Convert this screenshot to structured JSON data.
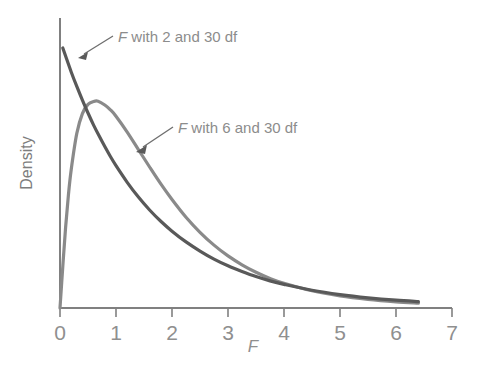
{
  "chart_data": {
    "type": "line",
    "title": "",
    "subtitle": "",
    "xlabel": "F",
    "ylabel": "Density",
    "xlim": [
      0,
      7
    ],
    "ylim": [
      0,
      1.05
    ],
    "grid": false,
    "legend_position": "inline-annotations",
    "x_ticks": [
      "0",
      "1",
      "2",
      "3",
      "4",
      "5",
      "6",
      "7"
    ],
    "x_tick_values": [
      0,
      1,
      2,
      3,
      4,
      5,
      6,
      7
    ],
    "y_ticks": [],
    "colors": {
      "curve_2_30": "#595959",
      "curve_6_30": "#8a8a8a",
      "axis": "#808080",
      "text": "#8c8c8c"
    },
    "annotations": [
      {
        "name": "label-f-2-30",
        "text": "F with 2 and 30 df",
        "target_x": 0.35,
        "target_y": 0.86
      },
      {
        "name": "label-f-6-30",
        "text": "F with 6 and 30 df",
        "target_x": 1.38,
        "target_y": 0.58
      }
    ],
    "series": [
      {
        "name": "F with 2 and 30 df",
        "df1": 2,
        "df2": 30,
        "color": "#595959",
        "x": [
          0.05,
          0.1,
          0.2,
          0.3,
          0.4,
          0.5,
          0.6,
          0.7,
          0.8,
          0.9,
          1.0,
          1.2,
          1.4,
          1.6,
          1.8,
          2.0,
          2.25,
          2.5,
          2.75,
          3.0,
          3.25,
          3.5,
          3.75,
          4.0,
          4.5,
          5.0,
          5.5,
          6.0,
          6.4
        ],
        "values": [
          0.968,
          0.938,
          0.879,
          0.825,
          0.774,
          0.726,
          0.681,
          0.64,
          0.601,
          0.564,
          0.53,
          0.468,
          0.413,
          0.365,
          0.323,
          0.286,
          0.246,
          0.212,
          0.182,
          0.157,
          0.136,
          0.117,
          0.101,
          0.088,
          0.066,
          0.05,
          0.038,
          0.029,
          0.024
        ]
      },
      {
        "name": "F with 6 and 30 df",
        "df1": 6,
        "df2": 30,
        "color": "#8a8a8a",
        "peak_x": 0.68,
        "peak_y": 0.77,
        "x": [
          0.0,
          0.05,
          0.1,
          0.15,
          0.2,
          0.3,
          0.4,
          0.5,
          0.6,
          0.68,
          0.8,
          0.9,
          1.0,
          1.2,
          1.4,
          1.6,
          1.8,
          2.0,
          2.25,
          2.5,
          2.75,
          3.0,
          3.25,
          3.5,
          3.75,
          4.0,
          4.5,
          5.0,
          5.5,
          6.0,
          6.4
        ],
        "values": [
          0.0,
          0.155,
          0.3,
          0.42,
          0.515,
          0.65,
          0.724,
          0.758,
          0.769,
          0.77,
          0.756,
          0.738,
          0.714,
          0.655,
          0.59,
          0.525,
          0.462,
          0.404,
          0.338,
          0.282,
          0.234,
          0.194,
          0.161,
          0.133,
          0.11,
          0.092,
          0.064,
          0.045,
          0.032,
          0.023,
          0.018
        ]
      }
    ]
  },
  "axes": {
    "x_axis_name": "x-axis",
    "y_axis_name": "y-axis",
    "x_title": "F",
    "y_title": "Density"
  }
}
